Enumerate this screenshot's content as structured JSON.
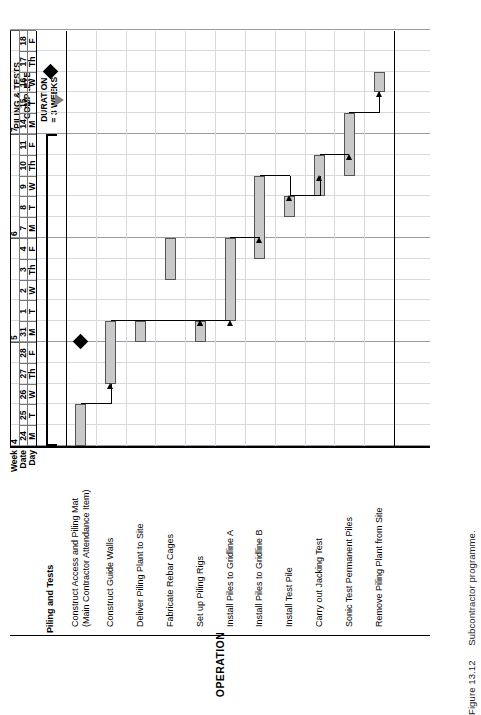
{
  "figure": {
    "number": "Figure 13.12",
    "caption": "Subcontractor programme."
  },
  "table": {
    "operation_header": "OPERATION",
    "row_labels": {
      "week": "Week",
      "date": "Date",
      "day": "Day"
    },
    "group_title": "Piling and Tests"
  },
  "timeline": {
    "weeks": [
      {
        "label": "4",
        "start_col": 0,
        "span": 5
      },
      {
        "label": "5",
        "start_col": 5,
        "span": 5
      },
      {
        "label": "6",
        "start_col": 10,
        "span": 5
      },
      {
        "label": "7",
        "start_col": 15,
        "span": 5
      }
    ],
    "dates": [
      "24",
      "25",
      "26",
      "27",
      "28",
      "31",
      "1",
      "2",
      "3",
      "4",
      "7",
      "8",
      "9",
      "10",
      "11",
      "14",
      "15",
      "16",
      "17",
      "18"
    ],
    "days": [
      "M",
      "T",
      "W",
      "Th",
      "F",
      "M",
      "T",
      "W",
      "Th",
      "F",
      "M",
      "T",
      "W",
      "Th",
      "F",
      "M",
      "T",
      "W",
      "Th",
      "F"
    ]
  },
  "operations": [
    {
      "name": "Piling and Tests",
      "is_group": true
    },
    {
      "name": "Construct Access and Piling Mat",
      "name2": "(Main Contractor Attendance Item)"
    },
    {
      "name": "Construct Guide Walls"
    },
    {
      "name": "Deliver Piling Plant to Site"
    },
    {
      "name": "Fabricate Rebar Cages"
    },
    {
      "name": "Set up Piling Rigs"
    },
    {
      "name": "Install Piles to Gridline A"
    },
    {
      "name": "Install Piles to Gridline B"
    },
    {
      "name": "Install Test Pile"
    },
    {
      "name": "Carry out Jacking Test"
    },
    {
      "name": "Sonic Test Permanent Piles"
    },
    {
      "name": "Remove Piling Plant from Site"
    }
  ],
  "annotations": {
    "piling_tests_complete": "PILING & TESTS\nCOMPLETE",
    "piling_tests_complete_l1": "PILING & TESTS",
    "piling_tests_complete_l2": "COMPLETE",
    "duration_l1": "DURATION",
    "duration_l2": "= 3 WEEKS"
  },
  "chart_data": {
    "type": "bar",
    "title": "Subcontractor programme",
    "xlabel": "",
    "ylabel": "",
    "categories": [
      "Piling and Tests",
      "Construct Access and Piling Mat (Main Contractor Attendance Item)",
      "Construct Guide Walls",
      "Deliver Piling Plant to Site",
      "Fabricate Rebar Cages",
      "Set up Piling Rigs",
      "Install Piles to Gridline A",
      "Install Piles to Gridline B",
      "Install Test Pile",
      "Carry out Jacking Test",
      "Sonic Test Permanent Piles",
      "Remove Piling Plant from Site"
    ],
    "x": [
      "24 M",
      "25 T",
      "26 W",
      "27 Th",
      "28 F",
      "31 M",
      "1 T",
      "2 W",
      "3 Th",
      "4 F",
      "7 M",
      "8 T",
      "9 W",
      "10 Th",
      "11 F",
      "14 M",
      "15 T",
      "16 W",
      "17 Th",
      "18 F"
    ],
    "axis_ranges": {
      "x_days": 20,
      "weeks": 4
    },
    "grid": true,
    "legend": "none",
    "bars": [
      {
        "task": "Piling and Tests",
        "start_day": 0,
        "duration_days": 15,
        "style": "summary"
      },
      {
        "task": "Construct Access and Piling Mat",
        "start_day": 0,
        "duration_days": 2,
        "style": "bar"
      },
      {
        "task": "Construct Guide Walls",
        "start_day": 3,
        "duration_days": 3,
        "style": "bar"
      },
      {
        "task": "Deliver Piling Plant to Site",
        "start_day": 5,
        "duration_days": 1,
        "style": "bar"
      },
      {
        "task": "Fabricate Rebar Cages",
        "start_day": 8,
        "duration_days": 2,
        "style": "bar"
      },
      {
        "task": "Set up Piling Rigs",
        "start_day": 5,
        "duration_days": 1,
        "style": "bar"
      },
      {
        "task": "Install Piles to Gridline A",
        "start_day": 6,
        "duration_days": 4,
        "style": "bar"
      },
      {
        "task": "Install Piles to Gridline B",
        "start_day": 9,
        "duration_days": 4,
        "style": "bar"
      },
      {
        "task": "Install Test Pile",
        "start_day": 11,
        "duration_days": 1,
        "style": "bar"
      },
      {
        "task": "Carry out Jacking Test",
        "start_day": 12,
        "duration_days": 2,
        "style": "bar"
      },
      {
        "task": "Sonic Test Permanent Piles",
        "start_day": 13,
        "duration_days": 3,
        "style": "bar"
      },
      {
        "task": "Remove Piling Plant from Site",
        "start_day": 17,
        "duration_days": 1,
        "style": "bar"
      }
    ],
    "milestones": [
      {
        "label": "Guide walls complete",
        "day": 5
      },
      {
        "label": "Piling & tests complete",
        "day": 18
      }
    ],
    "annotations": [
      {
        "text": "PILING & TESTS COMPLETE",
        "day": 17
      },
      {
        "text": "DURATION = 3 WEEKS",
        "day": 16
      }
    ]
  }
}
